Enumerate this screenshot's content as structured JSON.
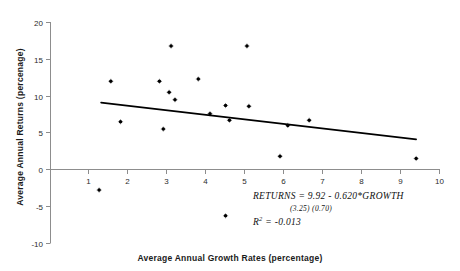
{
  "chart_data": {
    "type": "scatter",
    "title": "",
    "xlabel": "Average Annual Growth Rates (percentage)",
    "ylabel": "Average Annual Returns (percenage)",
    "xlim": [
      0,
      10
    ],
    "ylim": [
      -10,
      20
    ],
    "xticks": [
      1,
      2,
      3,
      4,
      5,
      6,
      7,
      8,
      9,
      10
    ],
    "yticks": [
      -10,
      -5,
      0,
      5,
      10,
      15,
      20
    ],
    "xtick_labels": [
      "1",
      "2",
      "3",
      "4",
      "5",
      "6",
      "7",
      "8",
      "9",
      "10"
    ],
    "ytick_labels": [
      "-10",
      "-5",
      "0",
      "5",
      "10",
      "15",
      "20"
    ],
    "grid": false,
    "legend": false,
    "marker": "dot-plus",
    "marker_color": "#000000",
    "series": [
      {
        "name": "Country observations",
        "points": [
          {
            "x": 1.25,
            "y": -2.8
          },
          {
            "x": 1.55,
            "y": 12.0
          },
          {
            "x": 1.8,
            "y": 6.5
          },
          {
            "x": 2.8,
            "y": 12.0
          },
          {
            "x": 2.9,
            "y": 5.5
          },
          {
            "x": 3.05,
            "y": 10.5
          },
          {
            "x": 3.1,
            "y": 16.8
          },
          {
            "x": 3.2,
            "y": 9.5
          },
          {
            "x": 3.8,
            "y": 12.3
          },
          {
            "x": 4.1,
            "y": 7.6
          },
          {
            "x": 4.5,
            "y": 8.7
          },
          {
            "x": 4.5,
            "y": -6.3
          },
          {
            "x": 4.6,
            "y": 6.7
          },
          {
            "x": 5.05,
            "y": 16.8
          },
          {
            "x": 5.1,
            "y": 8.6
          },
          {
            "x": 5.9,
            "y": 1.8
          },
          {
            "x": 6.1,
            "y": 6.0
          },
          {
            "x": 6.65,
            "y": 6.7
          },
          {
            "x": 9.4,
            "y": 1.5
          }
        ]
      }
    ],
    "fit_line": {
      "name": "OLS regression line",
      "intercept": 9.92,
      "slope": -0.62,
      "x_start": 1.3,
      "x_end": 9.4,
      "y_start": 9.1,
      "y_end": 4.1,
      "color": "#000000"
    },
    "annotations": {
      "equation": "RETURNS  =  9.92 -  0.620*GROWTH",
      "std_errors": "(3.25)      (0.70)",
      "r_squared_label": "R",
      "r_squared_exponent": "2",
      "r_squared_value": "=  -0.013"
    }
  },
  "axes": {
    "x_title": "Average Annual Growth Rates (percentage)",
    "y_title": "Average Annual Returns (percenage)"
  }
}
